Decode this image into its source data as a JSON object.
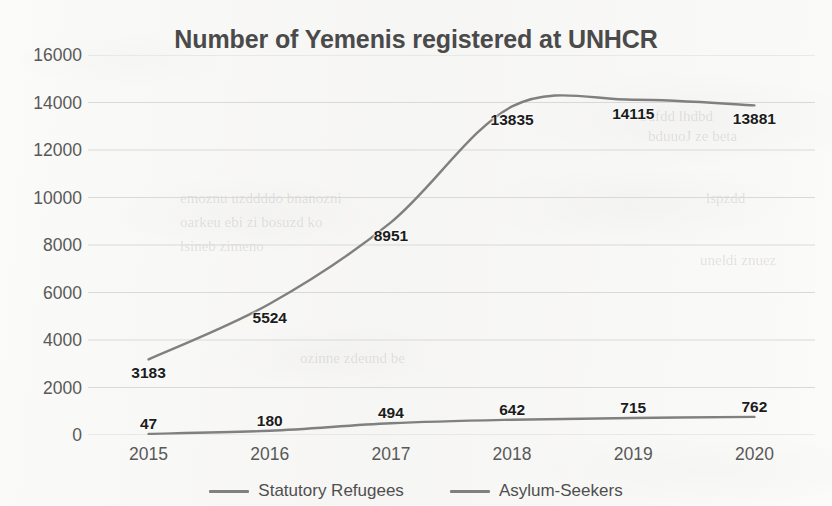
{
  "chart_data": {
    "type": "line",
    "title": "Number of Yemenis registered at UNHCR",
    "xlabel": "",
    "ylabel": "",
    "categories": [
      "2015",
      "2016",
      "2017",
      "2018",
      "2019",
      "2020"
    ],
    "series": [
      {
        "name": "Statutory Refugees",
        "color": "#808080",
        "values": [
          3183,
          5524,
          8951,
          13835,
          14115,
          13881
        ],
        "labels": [
          "3183",
          "5524",
          "8951",
          "13835",
          "14115",
          "13881"
        ]
      },
      {
        "name": "Asylum-Seekers",
        "color": "#808080",
        "values": [
          47,
          180,
          494,
          642,
          715,
          762
        ],
        "labels": [
          "47",
          "180",
          "494",
          "642",
          "715",
          "762"
        ]
      }
    ],
    "ylim": [
      0,
      16000
    ],
    "yticks": [
      16000,
      14000,
      12000,
      10000,
      8000,
      6000,
      4000,
      2000,
      0
    ],
    "ytick_labels": [
      "16000",
      "14000",
      "12000",
      "10000",
      "8000",
      "6000",
      "4000",
      "2000",
      "0"
    ],
    "grid": true,
    "grid_color": "#d9d9d9",
    "legend_position": "bottom",
    "smoothing": "spline",
    "data_labels_shown": true,
    "background_color": "#fbfbfa"
  }
}
